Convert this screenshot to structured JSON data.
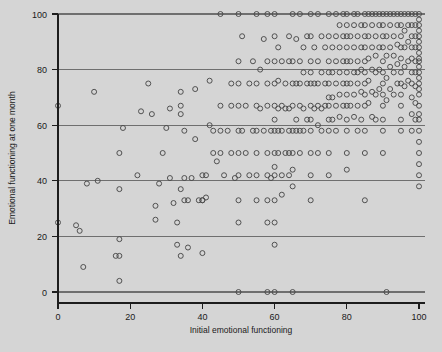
{
  "chart_data": {
    "type": "scatter",
    "title": "",
    "xlabel": "Initial emotional functioning",
    "ylabel": "Emotional functioning at one month",
    "xlim": [
      0,
      100
    ],
    "ylim": [
      0,
      100
    ],
    "xticks": [
      0,
      20,
      40,
      60,
      80,
      100
    ],
    "yticks": [
      0,
      20,
      40,
      60,
      80,
      100
    ],
    "xtick_labels": [
      "0",
      "20",
      "40",
      "60",
      "80",
      "100"
    ],
    "ytick_labels": [
      "0",
      "20",
      "40",
      "60",
      "80",
      "100"
    ],
    "grid": "horizontal",
    "gridlines_y": [
      0,
      20,
      40,
      60,
      80,
      100
    ],
    "legend": "none",
    "marker": "open-circle",
    "marker_color": "#4a4a4a",
    "marker_size": 5,
    "background_color": "#d5d5d5",
    "grid_color": "#6f6f6f",
    "axis_color": "#1d1d1d",
    "n_points": 336,
    "points": [
      [
        0,
        67
      ],
      [
        0,
        25
      ],
      [
        5,
        24
      ],
      [
        6,
        22
      ],
      [
        7,
        9
      ],
      [
        8,
        39
      ],
      [
        10,
        72
      ],
      [
        11,
        40
      ],
      [
        17,
        19
      ],
      [
        16,
        13
      ],
      [
        17,
        13
      ],
      [
        17,
        4
      ],
      [
        17,
        37
      ],
      [
        17,
        50
      ],
      [
        18,
        59
      ],
      [
        22,
        42
      ],
      [
        23,
        65
      ],
      [
        25,
        75
      ],
      [
        26,
        64
      ],
      [
        27,
        31
      ],
      [
        27,
        26
      ],
      [
        28,
        39
      ],
      [
        29,
        50
      ],
      [
        30,
        59
      ],
      [
        31,
        66
      ],
      [
        31,
        41
      ],
      [
        32,
        32
      ],
      [
        33,
        25
      ],
      [
        33,
        17
      ],
      [
        34,
        72
      ],
      [
        34,
        67
      ],
      [
        34,
        64
      ],
      [
        34,
        37
      ],
      [
        34,
        13
      ],
      [
        35,
        33
      ],
      [
        35,
        58
      ],
      [
        35,
        41
      ],
      [
        36,
        33
      ],
      [
        36,
        16
      ],
      [
        37,
        41
      ],
      [
        38,
        73
      ],
      [
        38,
        55
      ],
      [
        39,
        33
      ],
      [
        40,
        42
      ],
      [
        40,
        33
      ],
      [
        40,
        33
      ],
      [
        40,
        14
      ],
      [
        41,
        42
      ],
      [
        41,
        34
      ],
      [
        42,
        76
      ],
      [
        42,
        60
      ],
      [
        43,
        58
      ],
      [
        43,
        50
      ],
      [
        44,
        47
      ],
      [
        45,
        100
      ],
      [
        45,
        67
      ],
      [
        45,
        58
      ],
      [
        45,
        50
      ],
      [
        46,
        42
      ],
      [
        47,
        58
      ],
      [
        48,
        75
      ],
      [
        48,
        67
      ],
      [
        48,
        50
      ],
      [
        49,
        41
      ],
      [
        50,
        100
      ],
      [
        50,
        83
      ],
      [
        50,
        75
      ],
      [
        50,
        67
      ],
      [
        50,
        58
      ],
      [
        50,
        50
      ],
      [
        50,
        42
      ],
      [
        50,
        33
      ],
      [
        50,
        25
      ],
      [
        50,
        0
      ],
      [
        51,
        92
      ],
      [
        51,
        58
      ],
      [
        52,
        67
      ],
      [
        52,
        50
      ],
      [
        53,
        75
      ],
      [
        53,
        42
      ],
      [
        54,
        83
      ],
      [
        54,
        58
      ],
      [
        55,
        100
      ],
      [
        55,
        75
      ],
      [
        55,
        67
      ],
      [
        55,
        58
      ],
      [
        55,
        50
      ],
      [
        55,
        42
      ],
      [
        55,
        33
      ],
      [
        56,
        80
      ],
      [
        56,
        66
      ],
      [
        57,
        91
      ],
      [
        57,
        58
      ],
      [
        58,
        100
      ],
      [
        58,
        83
      ],
      [
        58,
        75
      ],
      [
        58,
        67
      ],
      [
        58,
        50
      ],
      [
        58,
        42
      ],
      [
        58,
        33
      ],
      [
        58,
        25
      ],
      [
        58,
        0
      ],
      [
        59,
        58
      ],
      [
        59,
        41
      ],
      [
        60,
        100
      ],
      [
        60,
        92
      ],
      [
        60,
        83
      ],
      [
        60,
        75
      ],
      [
        60,
        67
      ],
      [
        60,
        62
      ],
      [
        60,
        58
      ],
      [
        60,
        50
      ],
      [
        60,
        45
      ],
      [
        60,
        42
      ],
      [
        60,
        33
      ],
      [
        60,
        25
      ],
      [
        60,
        17
      ],
      [
        60,
        0
      ],
      [
        61,
        88
      ],
      [
        61,
        76
      ],
      [
        61,
        66
      ],
      [
        61,
        58
      ],
      [
        61,
        50
      ],
      [
        62,
        83
      ],
      [
        62,
        67
      ],
      [
        62,
        58
      ],
      [
        62,
        42
      ],
      [
        62,
        35
      ],
      [
        63,
        75
      ],
      [
        63,
        66
      ],
      [
        63,
        50
      ],
      [
        64,
        92
      ],
      [
        64,
        83
      ],
      [
        64,
        66
      ],
      [
        64,
        58
      ],
      [
        64,
        50
      ],
      [
        64,
        42
      ],
      [
        65,
        100
      ],
      [
        65,
        83
      ],
      [
        65,
        75
      ],
      [
        65,
        67
      ],
      [
        65,
        58
      ],
      [
        65,
        50
      ],
      [
        65,
        44
      ],
      [
        65,
        38
      ],
      [
        65,
        0
      ],
      [
        66,
        91
      ],
      [
        66,
        75
      ],
      [
        66,
        62
      ],
      [
        66,
        58
      ],
      [
        67,
        100
      ],
      [
        67,
        83
      ],
      [
        67,
        75
      ],
      [
        67,
        67
      ],
      [
        67,
        58
      ],
      [
        67,
        50
      ],
      [
        68,
        88
      ],
      [
        68,
        79
      ],
      [
        68,
        66
      ],
      [
        68,
        58
      ],
      [
        69,
        92
      ],
      [
        69,
        75
      ],
      [
        69,
        62
      ],
      [
        70,
        100
      ],
      [
        70,
        92
      ],
      [
        70,
        83
      ],
      [
        70,
        79
      ],
      [
        70,
        75
      ],
      [
        70,
        67
      ],
      [
        70,
        62
      ],
      [
        70,
        58
      ],
      [
        70,
        50
      ],
      [
        70,
        42
      ],
      [
        70,
        33
      ],
      [
        71,
        88
      ],
      [
        71,
        75
      ],
      [
        71,
        66
      ],
      [
        72,
        100
      ],
      [
        72,
        83
      ],
      [
        72,
        75
      ],
      [
        72,
        67
      ],
      [
        72,
        60
      ],
      [
        72,
        50
      ],
      [
        73,
        92
      ],
      [
        73,
        79
      ],
      [
        73,
        66
      ],
      [
        73,
        58
      ],
      [
        74,
        88
      ],
      [
        74,
        75
      ],
      [
        74,
        67
      ],
      [
        75,
        100
      ],
      [
        75,
        92
      ],
      [
        75,
        83
      ],
      [
        75,
        79
      ],
      [
        75,
        75
      ],
      [
        75,
        70
      ],
      [
        75,
        67
      ],
      [
        75,
        62
      ],
      [
        75,
        58
      ],
      [
        75,
        50
      ],
      [
        75,
        42
      ],
      [
        76,
        88
      ],
      [
        76,
        79
      ],
      [
        76,
        70
      ],
      [
        76,
        62
      ],
      [
        77,
        100
      ],
      [
        77,
        92
      ],
      [
        77,
        83
      ],
      [
        77,
        75
      ],
      [
        77,
        67
      ],
      [
        77,
        58
      ],
      [
        78,
        96
      ],
      [
        78,
        88
      ],
      [
        78,
        79
      ],
      [
        78,
        71
      ],
      [
        78,
        63
      ],
      [
        79,
        100
      ],
      [
        79,
        92
      ],
      [
        79,
        83
      ],
      [
        79,
        75
      ],
      [
        79,
        67
      ],
      [
        80,
        100
      ],
      [
        80,
        96
      ],
      [
        80,
        92
      ],
      [
        80,
        88
      ],
      [
        80,
        83
      ],
      [
        80,
        79
      ],
      [
        80,
        75
      ],
      [
        80,
        71
      ],
      [
        80,
        67
      ],
      [
        80,
        62
      ],
      [
        80,
        58
      ],
      [
        80,
        50
      ],
      [
        80,
        44
      ],
      [
        81,
        92
      ],
      [
        81,
        83
      ],
      [
        81,
        75
      ],
      [
        81,
        67
      ],
      [
        82,
        100
      ],
      [
        82,
        96
      ],
      [
        82,
        88
      ],
      [
        82,
        79
      ],
      [
        82,
        71
      ],
      [
        82,
        63
      ],
      [
        83,
        100
      ],
      [
        83,
        92
      ],
      [
        83,
        83
      ],
      [
        83,
        79
      ],
      [
        83,
        75
      ],
      [
        83,
        67
      ],
      [
        83,
        58
      ],
      [
        84,
        96
      ],
      [
        84,
        88
      ],
      [
        84,
        80
      ],
      [
        84,
        72
      ],
      [
        84,
        62
      ],
      [
        85,
        100
      ],
      [
        85,
        96
      ],
      [
        85,
        92
      ],
      [
        85,
        88
      ],
      [
        85,
        83
      ],
      [
        85,
        79
      ],
      [
        85,
        75
      ],
      [
        85,
        71
      ],
      [
        85,
        67
      ],
      [
        85,
        58
      ],
      [
        85,
        50
      ],
      [
        85,
        33
      ],
      [
        86,
        100
      ],
      [
        86,
        92
      ],
      [
        86,
        84
      ],
      [
        86,
        76
      ],
      [
        86,
        68
      ],
      [
        87,
        100
      ],
      [
        87,
        96
      ],
      [
        87,
        88
      ],
      [
        87,
        80
      ],
      [
        87,
        72
      ],
      [
        87,
        63
      ],
      [
        88,
        100
      ],
      [
        88,
        92
      ],
      [
        88,
        85
      ],
      [
        88,
        79
      ],
      [
        88,
        71
      ],
      [
        88,
        62
      ],
      [
        89,
        100
      ],
      [
        89,
        96
      ],
      [
        89,
        88
      ],
      [
        89,
        80
      ],
      [
        89,
        73
      ],
      [
        90,
        100
      ],
      [
        90,
        96
      ],
      [
        90,
        92
      ],
      [
        90,
        88
      ],
      [
        90,
        83
      ],
      [
        90,
        79
      ],
      [
        90,
        75
      ],
      [
        90,
        71
      ],
      [
        90,
        67
      ],
      [
        90,
        62
      ],
      [
        90,
        58
      ],
      [
        90,
        50
      ],
      [
        91,
        100
      ],
      [
        91,
        92
      ],
      [
        91,
        85
      ],
      [
        91,
        77
      ],
      [
        91,
        69
      ],
      [
        91,
        0
      ],
      [
        92,
        100
      ],
      [
        92,
        96
      ],
      [
        92,
        88
      ],
      [
        92,
        81
      ],
      [
        92,
        73
      ],
      [
        93,
        100
      ],
      [
        93,
        92
      ],
      [
        93,
        85
      ],
      [
        93,
        79
      ],
      [
        93,
        71
      ],
      [
        94,
        100
      ],
      [
        94,
        96
      ],
      [
        94,
        89
      ],
      [
        94,
        82
      ],
      [
        94,
        75
      ],
      [
        95,
        100
      ],
      [
        95,
        96
      ],
      [
        95,
        92
      ],
      [
        95,
        88
      ],
      [
        95,
        84
      ],
      [
        95,
        79
      ],
      [
        95,
        75
      ],
      [
        95,
        71
      ],
      [
        95,
        67
      ],
      [
        95,
        62
      ],
      [
        95,
        58
      ],
      [
        96,
        100
      ],
      [
        96,
        94
      ],
      [
        96,
        88
      ],
      [
        96,
        81
      ],
      [
        96,
        74
      ],
      [
        97,
        100
      ],
      [
        97,
        96
      ],
      [
        97,
        90
      ],
      [
        97,
        83
      ],
      [
        97,
        76
      ],
      [
        98,
        100
      ],
      [
        98,
        96
      ],
      [
        98,
        92
      ],
      [
        98,
        88
      ],
      [
        98,
        84
      ],
      [
        98,
        79
      ],
      [
        98,
        75
      ],
      [
        98,
        70
      ],
      [
        98,
        64
      ],
      [
        98,
        58
      ],
      [
        99,
        100
      ],
      [
        99,
        96
      ],
      [
        99,
        92
      ],
      [
        99,
        88
      ],
      [
        99,
        83
      ],
      [
        99,
        79
      ],
      [
        99,
        74
      ],
      [
        99,
        68
      ],
      [
        99,
        62
      ],
      [
        100,
        100
      ],
      [
        100,
        98
      ],
      [
        100,
        96
      ],
      [
        100,
        94
      ],
      [
        100,
        92
      ],
      [
        100,
        90
      ],
      [
        100,
        88
      ],
      [
        100,
        86
      ],
      [
        100,
        84
      ],
      [
        100,
        83
      ],
      [
        100,
        81
      ],
      [
        100,
        79
      ],
      [
        100,
        77
      ],
      [
        100,
        75
      ],
      [
        100,
        73
      ],
      [
        100,
        71
      ],
      [
        100,
        67
      ],
      [
        100,
        64
      ],
      [
        100,
        62
      ],
      [
        100,
        58
      ],
      [
        100,
        54
      ],
      [
        100,
        50
      ],
      [
        100,
        46
      ],
      [
        100,
        42
      ],
      [
        100,
        38
      ]
    ]
  }
}
